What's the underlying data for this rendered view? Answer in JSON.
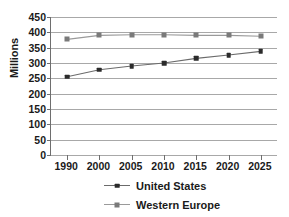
{
  "chart_data": {
    "type": "line",
    "title": "",
    "subtitle": "",
    "xlabel": "",
    "ylabel": "Millions",
    "categories": [
      "1990",
      "2000",
      "2005",
      "2010",
      "2015",
      "2020",
      "2025"
    ],
    "series": [
      {
        "name": "United States",
        "marker": "diamond",
        "color": "#2b2b2b",
        "line_color": "#6b6b6b",
        "values": [
          255,
          278,
          290,
          300,
          315,
          326,
          338
        ]
      },
      {
        "name": "Western Europe",
        "marker": "square",
        "color": "#7a7a7a",
        "line_color": "#9a9a9a",
        "values": [
          377,
          390,
          392,
          392,
          390,
          390,
          387
        ]
      }
    ],
    "ylim": [
      0,
      450
    ],
    "ytick_step": 50,
    "yticks": [
      450,
      400,
      350,
      300,
      250,
      200,
      150,
      100,
      50,
      0
    ],
    "grid": true,
    "grid_axis": "y",
    "legend_position": "bottom",
    "axis_color": "#6e6e6e",
    "grid_color": "#a8a8a8",
    "background": "#ffffff"
  },
  "legend": {
    "items": [
      {
        "label": "United States"
      },
      {
        "label": "Western Europe"
      }
    ]
  }
}
